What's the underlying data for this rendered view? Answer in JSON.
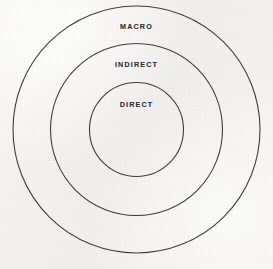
{
  "diagram": {
    "type": "concentric-circles",
    "title": "",
    "background_color": "#f3f2f0",
    "stroke_color": "#3a3a3a",
    "text_color": "#2e2e2e",
    "center": {
      "x": 136.5,
      "y": 129.5
    },
    "rings": [
      {
        "id": "macro",
        "label": "MACRO",
        "radius": 123.5,
        "level": 3,
        "label_position": {
          "x": 136.5,
          "y": 26
        }
      },
      {
        "id": "indirect",
        "label": "INDIRECT",
        "radius": 86,
        "level": 2,
        "label_position": {
          "x": 136.5,
          "y": 64
        }
      },
      {
        "id": "direct",
        "label": "DIRECT",
        "radius": 47,
        "level": 1,
        "label_position": {
          "x": 136.5,
          "y": 104
        }
      }
    ]
  },
  "chart_data": {
    "type": "pie",
    "title": "",
    "xlabel": "",
    "ylabel": "",
    "categories": [
      "DIRECT",
      "INDIRECT",
      "MACRO"
    ],
    "values": [
      47,
      86,
      123.5
    ],
    "series": [
      {
        "name": "radius",
        "values": [
          47,
          86,
          123.5
        ]
      }
    ],
    "annotations": [
      "MACRO",
      "INDIRECT",
      "DIRECT"
    ],
    "legend_position": "none",
    "grid": false
  }
}
